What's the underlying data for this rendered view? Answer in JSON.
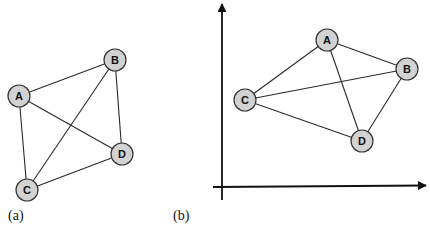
{
  "colors": {
    "node_fill": "#d2d2d2",
    "node_stroke": "#333333",
    "edge": "#2a2a2a",
    "axis": "#111111",
    "background": "#ffffff"
  },
  "panels": [
    {
      "label": "(a)",
      "label_pos": [
        8,
        220
      ],
      "axes": null,
      "nodes": [
        {
          "id": "A",
          "label": "A",
          "x": 19,
          "y": 96
        },
        {
          "id": "B",
          "label": "B",
          "x": 115,
          "y": 60
        },
        {
          "id": "C",
          "label": "C",
          "x": 27,
          "y": 190
        },
        {
          "id": "D",
          "label": "D",
          "x": 122,
          "y": 154
        }
      ],
      "edges": [
        [
          "A",
          "B"
        ],
        [
          "A",
          "C"
        ],
        [
          "A",
          "D"
        ],
        [
          "B",
          "C"
        ],
        [
          "B",
          "D"
        ],
        [
          "C",
          "D"
        ]
      ]
    },
    {
      "label": "(b)",
      "label_pos": [
        173,
        220
      ],
      "axes": {
        "y_axis": {
          "x": 222,
          "y_top": 4,
          "y_bottom": 200
        },
        "x_axis": {
          "y": 187,
          "x_left": 213,
          "x_right": 426
        }
      },
      "nodes": [
        {
          "id": "A",
          "label": "A",
          "x": 327,
          "y": 40
        },
        {
          "id": "B",
          "label": "B",
          "x": 407,
          "y": 69
        },
        {
          "id": "C",
          "label": "C",
          "x": 245,
          "y": 100
        },
        {
          "id": "D",
          "label": "D",
          "x": 362,
          "y": 141
        }
      ],
      "edges": [
        [
          "A",
          "B"
        ],
        [
          "A",
          "C"
        ],
        [
          "A",
          "D"
        ],
        [
          "B",
          "C"
        ],
        [
          "B",
          "D"
        ],
        [
          "C",
          "D"
        ]
      ]
    }
  ],
  "node_radius": 11
}
